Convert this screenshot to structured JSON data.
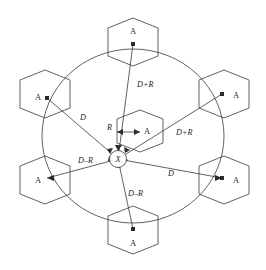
{
  "figure": {
    "type": "geometry-diagram",
    "center_node": {
      "label": "X"
    },
    "center_cell": {
      "label": "A"
    },
    "radius_label": "R",
    "radius_target_label": "A",
    "ring_cells": [
      {
        "id": "top",
        "label": "A"
      },
      {
        "id": "upper-right",
        "label": "A"
      },
      {
        "id": "lower-right",
        "label": "A"
      },
      {
        "id": "bottom",
        "label": "A"
      },
      {
        "id": "lower-left",
        "label": "A"
      },
      {
        "id": "upper-left",
        "label": "A"
      }
    ],
    "distance_labels": [
      {
        "id": "d-plus-r-top",
        "text": "D+R"
      },
      {
        "id": "d-plus-r-right",
        "text": "D+R"
      },
      {
        "id": "d-left",
        "text": "D"
      },
      {
        "id": "d-right",
        "text": "D"
      },
      {
        "id": "d-minus-r-left",
        "text": "D–R"
      },
      {
        "id": "d-minus-r-bottom",
        "text": "D–R"
      }
    ],
    "colors": {
      "stroke": "#3a3a3a",
      "text": "#1f1f1f",
      "dot": "#2b2b2b",
      "background": "#ffffff"
    }
  }
}
